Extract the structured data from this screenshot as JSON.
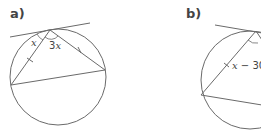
{
  "diagrams": [
    {
      "id": "a",
      "label": "a)",
      "angles": [
        {
          "name": "tangent-chord-angle",
          "label_var": "x",
          "label_coef": ""
        },
        {
          "name": "inscribed-angle",
          "label_coef": "3",
          "label_var": "x"
        }
      ],
      "equal_chord_ticks": 2
    },
    {
      "id": "b",
      "label": "b)",
      "angles": [
        {
          "name": "tangent-chord-angle",
          "label_var": "x",
          "label_rest": " − 30"
        }
      ],
      "equal_chord_ticks": 1
    }
  ],
  "colors": {
    "line": "#6a6a6a",
    "text": "#444444",
    "background": "#ffffff"
  }
}
